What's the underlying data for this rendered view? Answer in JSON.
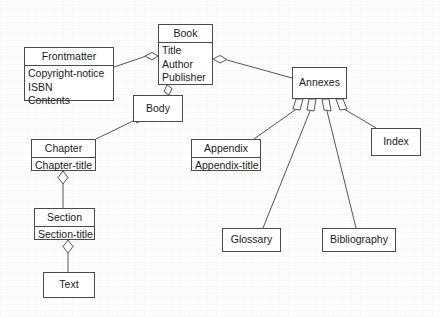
{
  "diagram": {
    "type": "uml-class-diagram",
    "stroke_color": "#4a4a4a",
    "fill_color": "#ffffff",
    "background_color": "#fdfdfd",
    "classes": [
      {
        "id": "book",
        "name": "Book",
        "attributes": [
          "Title",
          "Author",
          "Publisher"
        ],
        "x": 158,
        "y": 24,
        "w": 55,
        "h": 61
      },
      {
        "id": "frontmatter",
        "name": "Frontmatter",
        "attributes": [
          "Copyright-notice",
          "ISBN",
          "Contents"
        ],
        "x": 24,
        "y": 47,
        "w": 90,
        "h": 54
      },
      {
        "id": "body",
        "name": "Body",
        "attributes": [],
        "x": 133,
        "y": 95,
        "w": 50,
        "h": 27
      },
      {
        "id": "annexes",
        "name": "Annexes",
        "attributes": [],
        "x": 292,
        "y": 67,
        "w": 55,
        "h": 32
      },
      {
        "id": "chapter",
        "name": "Chapter",
        "attributes": [
          "Chapter-title"
        ],
        "x": 31,
        "y": 139,
        "w": 65,
        "h": 32
      },
      {
        "id": "appendix",
        "name": "Appendix",
        "attributes": [
          "Appendix-title"
        ],
        "x": 191,
        "y": 139,
        "w": 70,
        "h": 32
      },
      {
        "id": "index",
        "name": "Index",
        "attributes": [],
        "x": 371,
        "y": 128,
        "w": 50,
        "h": 28
      },
      {
        "id": "section",
        "name": "Section",
        "attributes": [
          "Section-title"
        ],
        "x": 34,
        "y": 208,
        "w": 61,
        "h": 32
      },
      {
        "id": "glossary",
        "name": "Glossary",
        "attributes": [],
        "x": 222,
        "y": 228,
        "w": 59,
        "h": 24
      },
      {
        "id": "bibliography",
        "name": "Bibliography",
        "attributes": [],
        "x": 322,
        "y": 228,
        "w": 74,
        "h": 24
      },
      {
        "id": "text",
        "name": "Text",
        "attributes": [],
        "x": 43,
        "y": 272,
        "w": 52,
        "h": 26
      }
    ],
    "associations": [
      {
        "from": "book",
        "to": "frontmatter",
        "kind": "aggregation",
        "diamond_at": "book"
      },
      {
        "from": "book",
        "to": "body",
        "kind": "aggregation",
        "diamond_at": "book"
      },
      {
        "from": "book",
        "to": "annexes",
        "kind": "aggregation",
        "diamond_at": "book"
      },
      {
        "from": "body",
        "to": "chapter",
        "kind": "aggregation",
        "diamond_at": "body"
      },
      {
        "from": "chapter",
        "to": "section",
        "kind": "aggregation",
        "diamond_at": "chapter"
      },
      {
        "from": "section",
        "to": "text",
        "kind": "aggregation",
        "diamond_at": "section"
      },
      {
        "from": "annexes",
        "to": "appendix",
        "kind": "aggregation",
        "diamond_at": "annexes"
      },
      {
        "from": "annexes",
        "to": "glossary",
        "kind": "aggregation",
        "diamond_at": "annexes"
      },
      {
        "from": "annexes",
        "to": "bibliography",
        "kind": "aggregation",
        "diamond_at": "annexes"
      },
      {
        "from": "annexes",
        "to": "index",
        "kind": "aggregation",
        "diamond_at": "annexes"
      }
    ]
  }
}
